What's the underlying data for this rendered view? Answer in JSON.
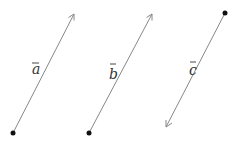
{
  "diagram": {
    "title": "",
    "vectors": [
      {
        "name": "a",
        "label": "a",
        "tail": [
          13,
          133
        ],
        "head": [
          74,
          14
        ],
        "label_pos": [
          32,
          74
        ]
      },
      {
        "name": "b",
        "label": "b",
        "tail": [
          89,
          133
        ],
        "head": [
          152,
          14
        ],
        "label_pos": [
          108,
          79
        ]
      },
      {
        "name": "c",
        "label": "c",
        "tail": [
          225,
          13
        ],
        "head": [
          166,
          127
        ],
        "label_pos": [
          189,
          75
        ]
      }
    ],
    "colors": {
      "line": "#888888",
      "point": "#111111",
      "text": "#333333"
    }
  }
}
